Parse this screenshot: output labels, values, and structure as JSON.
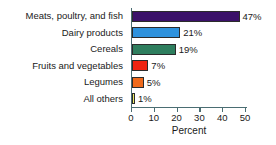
{
  "chart_data": {
    "type": "bar",
    "orientation": "horizontal",
    "title": "",
    "xlabel": "Percent",
    "ylabel": "",
    "xlim": [
      0,
      50
    ],
    "xticks": [
      0,
      10,
      20,
      30,
      40,
      50
    ],
    "xtick_labels": [
      "0",
      "10",
      "20",
      "30",
      "40",
      "50"
    ],
    "grid": false,
    "legend": "none",
    "categories": [
      "Meats, poultry, and fish",
      "Dairy products",
      "Cereals",
      "Fruits and vegetables",
      "Legumes",
      "All others"
    ],
    "values": [
      47,
      21,
      19,
      7,
      5,
      1
    ],
    "value_labels": [
      "47%",
      "21%",
      "19%",
      "7%",
      "5%",
      "1%"
    ],
    "bar_colors": [
      "#3b1169",
      "#2e92dd",
      "#2e7e5e",
      "#ee2311",
      "#ef6a1c",
      "#eeee66"
    ],
    "axis_color": "#4a6d72",
    "bar_outline_color": "#2b2b2b"
  }
}
